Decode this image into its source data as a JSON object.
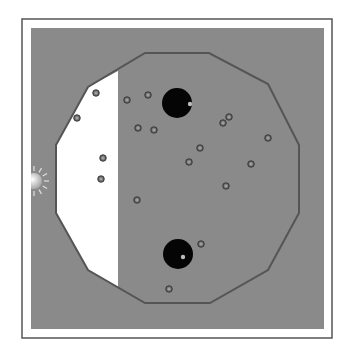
{
  "figure": {
    "width": 351,
    "height": 357,
    "colors": {
      "page_bg": "#ffffff",
      "frame_stroke": "#555555",
      "field_bg": "#8a8a8a",
      "dodecagon_stroke": "#555555",
      "lit_region": "#ffffff",
      "black_hole": "#050505",
      "particle_ring": "#3a3a3a",
      "particle_core": "#9a9a9a",
      "sun": "#e0e0e0"
    },
    "frame": {
      "x": 22,
      "y": 19,
      "w": 310,
      "h": 319
    },
    "field": {
      "x": 31,
      "y": 28,
      "w": 293,
      "h": 301
    },
    "dodecagon": {
      "points": [
        [
          145,
          53
        ],
        [
          209,
          53
        ],
        [
          268,
          84
        ],
        [
          299,
          145
        ],
        [
          299,
          213
        ],
        [
          268,
          270
        ],
        [
          210,
          303
        ],
        [
          145,
          303
        ],
        [
          88,
          270
        ],
        [
          56,
          213
        ],
        [
          56,
          145
        ],
        [
          88,
          87
        ]
      ]
    },
    "lit_region": {
      "points": [
        [
          118,
          71
        ],
        [
          88,
          87
        ],
        [
          56,
          145
        ],
        [
          56,
          213
        ],
        [
          88,
          270
        ],
        [
          118,
          287
        ]
      ]
    },
    "sun": {
      "cx": 34,
      "cy": 181,
      "r": 8,
      "rays": 7
    },
    "black_holes": [
      {
        "cx": 177,
        "cy": 103,
        "r": 15,
        "glint_x": 190,
        "glint_y": 104
      },
      {
        "cx": 178,
        "cy": 254,
        "r": 15,
        "glint_x": 183,
        "glint_y": 257
      }
    ],
    "particles": [
      {
        "x": 96,
        "y": 93
      },
      {
        "x": 77,
        "y": 118
      },
      {
        "x": 103,
        "y": 158
      },
      {
        "x": 101,
        "y": 179
      },
      {
        "x": 127,
        "y": 100
      },
      {
        "x": 148,
        "y": 95
      },
      {
        "x": 138,
        "y": 128
      },
      {
        "x": 154,
        "y": 130
      },
      {
        "x": 229,
        "y": 117
      },
      {
        "x": 223,
        "y": 123
      },
      {
        "x": 268,
        "y": 138
      },
      {
        "x": 200,
        "y": 148
      },
      {
        "x": 189,
        "y": 162
      },
      {
        "x": 251,
        "y": 164
      },
      {
        "x": 226,
        "y": 186
      },
      {
        "x": 137,
        "y": 200
      },
      {
        "x": 201,
        "y": 244
      },
      {
        "x": 169,
        "y": 289
      }
    ]
  }
}
